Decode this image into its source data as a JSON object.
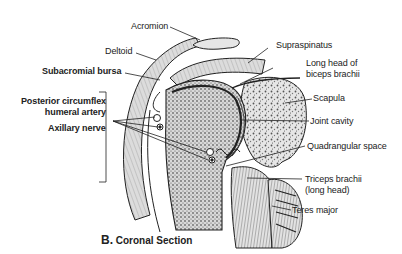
{
  "figure": {
    "caption_letter": "B.",
    "caption_text": "Coronal Section",
    "labels": {
      "acromion": "Acromion",
      "deltoid": "Deltoid",
      "subacromial_bursa": "Subacromial bursa",
      "posterior_circumflex_line1": "Posterior circumflex",
      "posterior_circumflex_line2": "humeral artery",
      "axillary_nerve": "Axillary nerve",
      "supraspinatus": "Supraspinatus",
      "long_head_biceps_line1": "Long head of",
      "long_head_biceps_line2": "biceps brachii",
      "scapula": "Scapula",
      "joint_cavity": "Joint cavity",
      "quadrangular_space": "Quadrangular space",
      "triceps_line1": "Triceps brachii",
      "triceps_line2": "(long head)",
      "teres_major": "Teres major"
    },
    "colors": {
      "ink": "#222222",
      "bone_fill": "#e8e8e8",
      "muscle_fill": "#d4d4d4",
      "background": "#ffffff"
    }
  }
}
